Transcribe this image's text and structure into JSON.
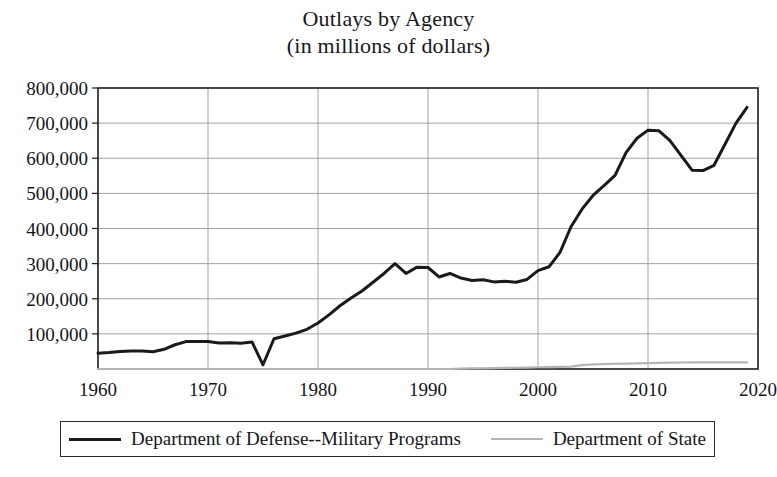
{
  "figure": {
    "title_line1": "Outlays by Agency",
    "title_line2": "(in millions of dollars)"
  },
  "legend": {
    "position": "bottom",
    "entries": [
      {
        "label": "Department of Defense--Military Programs",
        "color": "#1a1a1a"
      },
      {
        "label": "Department of State",
        "color": "#b4b4b4"
      }
    ]
  },
  "axes": {
    "y_ticks": [
      "100,000",
      "200,000",
      "300,000",
      "400,000",
      "500,000",
      "600,000",
      "700,000",
      "800,000"
    ],
    "x_ticks": [
      "1960",
      "1970",
      "1980",
      "1990",
      "2000",
      "2010",
      "2020"
    ]
  },
  "chart_data": {
    "type": "line",
    "title": "Outlays by Agency (in millions of dollars)",
    "xlabel": "",
    "ylabel": "",
    "xlim": [
      1960,
      2020
    ],
    "ylim": [
      0,
      800000
    ],
    "ytick_values": [
      100000,
      200000,
      300000,
      400000,
      500000,
      600000,
      700000,
      800000
    ],
    "xtick_values": [
      1960,
      1970,
      1980,
      1990,
      2000,
      2010,
      2020
    ],
    "grid": true,
    "legend_position": "bottom",
    "x": [
      1960,
      1961,
      1962,
      1963,
      1964,
      1965,
      1966,
      1967,
      1968,
      1969,
      1970,
      1971,
      1972,
      1973,
      1974,
      1975,
      1976,
      1977,
      1978,
      1979,
      1980,
      1981,
      1982,
      1983,
      1984,
      1985,
      1986,
      1987,
      1988,
      1989,
      1990,
      1991,
      1992,
      1993,
      1994,
      1995,
      1996,
      1997,
      1998,
      1999,
      2000,
      2001,
      2002,
      2003,
      2004,
      2005,
      2006,
      2007,
      2008,
      2009,
      2010,
      2011,
      2012,
      2013,
      2014,
      2015,
      2016,
      2017,
      2018,
      2019
    ],
    "series": [
      {
        "name": "Department of Defense--Military Programs",
        "color": "#1a1a1a",
        "values": [
          45000,
          47000,
          50000,
          51000,
          51000,
          49000,
          56000,
          69000,
          78000,
          78000,
          78000,
          74000,
          75000,
          73000,
          77000,
          12000,
          86000,
          94000,
          102000,
          113000,
          131000,
          154000,
          180000,
          202000,
          222000,
          247000,
          272000,
          300000,
          272000,
          290000,
          289000,
          262000,
          272000,
          259000,
          252000,
          254000,
          248000,
          250000,
          247000,
          255000,
          280000,
          291000,
          332000,
          405000,
          455000,
          494000,
          522000,
          551000,
          616000,
          657000,
          680000,
          678000,
          650000,
          608000,
          566000,
          565000,
          580000,
          640000,
          700000,
          745000
        ]
      },
      {
        "name": "Department of State",
        "color": "#b4b4b4",
        "values": [
          0,
          0,
          0,
          0,
          0,
          0,
          0,
          0,
          0,
          0,
          0,
          0,
          0,
          0,
          0,
          0,
          0,
          0,
          0,
          0,
          0,
          0,
          0,
          0,
          0,
          0,
          0,
          0,
          0,
          0,
          0,
          0,
          0,
          1000,
          1500,
          2000,
          2500,
          3000,
          3500,
          4000,
          5000,
          5500,
          6000,
          7000,
          11000,
          13000,
          14000,
          15000,
          15500,
          16000,
          17000,
          17500,
          18000,
          18500,
          19000,
          19000,
          19000,
          19000,
          19000,
          19000
        ]
      }
    ]
  }
}
